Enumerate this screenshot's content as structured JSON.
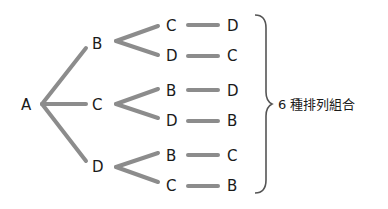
{
  "diagram": {
    "type": "tree",
    "root": "A",
    "colors": {
      "edge": "#8c8c8c",
      "text": "#1a1a1a",
      "brace": "#555555"
    },
    "level1": [
      "B",
      "C",
      "D"
    ],
    "level2": [
      "C",
      "D",
      "B",
      "D",
      "B",
      "C"
    ],
    "level3": [
      "D",
      "C",
      "D",
      "B",
      "C",
      "B"
    ],
    "paths": [
      "A-B-C-D",
      "A-B-D-C",
      "A-C-B-D",
      "A-C-D-B",
      "A-D-B-C",
      "A-D-C-B"
    ],
    "summary_label": "6 種排列組合"
  }
}
